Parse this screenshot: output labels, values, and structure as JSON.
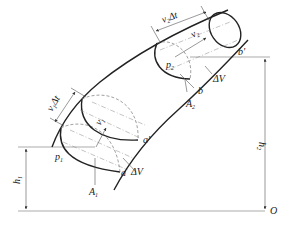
{
  "diagram": {
    "labels": {
      "v1_dt": {
        "base": "v",
        "sub": "1",
        "suffix": "Δt"
      },
      "v2_dt": {
        "base": "v",
        "sub": "2",
        "suffix": "Δt"
      },
      "v1": {
        "base": "v",
        "sub": "1"
      },
      "v2": {
        "base": "v",
        "sub": "2"
      },
      "p1": {
        "base": "p",
        "sub": "1"
      },
      "p2": {
        "base": "p",
        "sub": "2"
      },
      "A1": {
        "base": "A",
        "sub": "1"
      },
      "A2": {
        "base": "A",
        "sub": "2"
      },
      "h1": {
        "base": "h",
        "sub": "1"
      },
      "h2": {
        "base": "h",
        "sub": "2"
      },
      "a": "a",
      "a_prime": "a'",
      "b": "b",
      "b_prime": "b'",
      "dV_lower": "ΔV",
      "dV_upper": "ΔV",
      "origin": "O"
    }
  }
}
